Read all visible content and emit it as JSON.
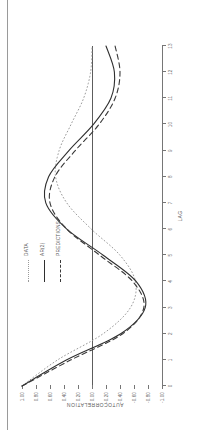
{
  "figure": {
    "kind": "autocorrelation-plot",
    "orientation": "rotated-90-ccw",
    "page_has_left_edge_line": true
  },
  "axis": {
    "y_title": "AUTOCORRELATION",
    "x_title": "LAG"
  },
  "legend": {
    "position": "top-center-right",
    "entries": [
      {
        "label": "DATA",
        "style": "dotted"
      },
      {
        "label": "AR(2)",
        "style": "solid"
      },
      {
        "label": "PREDICTIONS",
        "style": "dashed"
      }
    ]
  },
  "colors": {
    "axis": "#767676",
    "zero_line": "#5d5d5d",
    "solid_series": "#2f2f2f",
    "dashed_series": "#3a3a3a",
    "dotted_series": "#9b9b9b",
    "text": "#5d5d5d",
    "page_edge": "#9a9a9a",
    "background": "#ffffff"
  },
  "chart_data": {
    "type": "line",
    "title": "",
    "subtitle": "",
    "xlabel": "LAG",
    "ylabel": "AUTOCORRELATION",
    "xlim": [
      0,
      13
    ],
    "ylim": [
      -1.0,
      1.0
    ],
    "grid": false,
    "zero_reference_line": 0.0,
    "legend_position": "upper-center",
    "x_ticks": [
      0,
      1,
      2,
      3,
      4,
      5,
      6,
      7,
      8,
      9,
      10,
      11,
      12,
      13
    ],
    "x_tick_labels": [
      "0",
      "1",
      "2",
      "3",
      "4",
      "5",
      "6",
      "7",
      "8",
      "9",
      "10",
      "11",
      "12",
      "13"
    ],
    "y_ticks": [
      -1.0,
      -0.8,
      -0.6,
      -0.4,
      -0.2,
      0.0,
      0.2,
      0.4,
      0.6,
      0.8,
      1.0
    ],
    "y_tick_labels": [
      "-1.00",
      "-0.80",
      "-0.60",
      "-0.40",
      "-0.20",
      "0.00",
      "0.20",
      "0.40",
      "0.60",
      "0.80",
      "1.00"
    ],
    "x": [
      0,
      1,
      2,
      3,
      4,
      5,
      6,
      7,
      8,
      9,
      10,
      11,
      12,
      13
    ],
    "series": [
      {
        "name": "DATA",
        "style": "dotted",
        "color": "#9b9b9b",
        "values": [
          1.0,
          0.49,
          -0.16,
          -0.55,
          -0.62,
          -0.4,
          0.01,
          0.36,
          0.52,
          0.47,
          0.3,
          0.12,
          0.02,
          0.0
        ]
      },
      {
        "name": "AR(2)",
        "style": "solid",
        "color": "#2f2f2f",
        "values": [
          1.0,
          0.36,
          -0.41,
          -0.76,
          -0.63,
          -0.16,
          0.36,
          0.66,
          0.62,
          0.33,
          -0.02,
          -0.27,
          -0.32,
          -0.2
        ]
      },
      {
        "name": "PREDICTIONS",
        "style": "dashed",
        "color": "#3a3a3a",
        "values": [
          1.0,
          0.3,
          -0.44,
          -0.74,
          -0.58,
          -0.11,
          0.36,
          0.6,
          0.53,
          0.24,
          -0.1,
          -0.33,
          -0.4,
          -0.33
        ]
      }
    ]
  }
}
